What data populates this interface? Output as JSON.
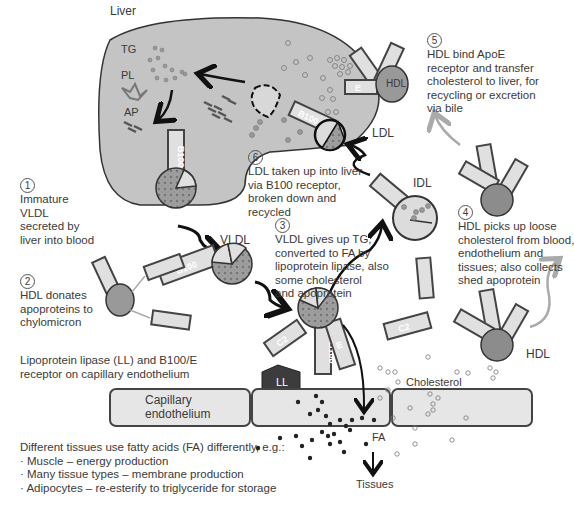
{
  "labels": {
    "liver": "Liver",
    "tg": "TG",
    "pl": "PL",
    "ap": "AP",
    "vldl": "VLDL",
    "idl": "IDL",
    "ldl": "LDL",
    "hdl_top": "HDL",
    "hdl_right": "HDL",
    "ll": "LL",
    "capillary": "Capillary\nendothelium",
    "cholesterol": "Cholesterol",
    "fa": "FA",
    "tissues": "Tissues"
  },
  "steps": [
    {
      "num": "1",
      "text": "Immature\nVLDL\nsecreted by\nliver into blood"
    },
    {
      "num": "2",
      "text": "HDL donates\napoproteins to\nchylomicron"
    },
    {
      "num": "3",
      "text": "VLDL gives up TG,\nconverted to FA by\nlipoprotein lipase, also\nsome cholesterol\nand apoprotein"
    },
    {
      "num": "4",
      "text": "HDL picks up loose\ncholesterol from blood,\nendothelium and\ntissues; also collects\nshed apoprotein"
    },
    {
      "num": "5",
      "text": "HDL bind ApoE\nreceptor and transfer\ncholesterol to liver, for\nrecycling or excretion\nvia bile"
    },
    {
      "num": "6",
      "text": "LDL taken up into liver\nvia B100 receptor,\nbroken down and\nrecycled"
    }
  ],
  "notes": {
    "ll_note": "Lipoprotein lipase (LL) and B100/E\nreceptor on capillary endothelium",
    "fa_note": "Different tissues use fatty acids (FA) differently, e.g.:\n· Muscle – energy production\n· Many tissue types – membrane production\n· Adipocytes – re-esterify to triglyceride for storage"
  },
  "apoproteins": [
    "B100",
    "E",
    "C2",
    "A"
  ],
  "colors": {
    "liver": "#c4c4c4",
    "particle": "#e0e0e0",
    "hdl_core": "#8c8c8c",
    "outline": "#444444",
    "ll": "#3c3c3c",
    "arrow_gray": "#aaaaaa"
  }
}
